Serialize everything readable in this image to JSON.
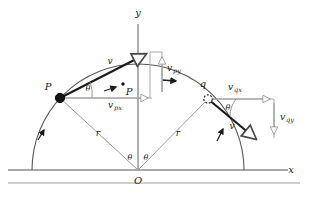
{
  "figure": {
    "background_color": "#ffffff",
    "stroke_dark": "#1a1a1a",
    "stroke_gray": "#8c8c8c",
    "stroke_mid": "#6e6e6e"
  },
  "axes": {
    "x_label": "x",
    "y_label": "y",
    "origin_label": "O"
  },
  "points": {
    "p_label": "P",
    "p_arc_label": "P",
    "q_label": "q"
  },
  "radii": {
    "left_label": "r",
    "right_label": "r"
  },
  "angles": {
    "at_p": "θ",
    "at_q": "θ",
    "at_origin_left": "θ",
    "at_origin_right": "θ"
  },
  "vectors": {
    "v_at_p": "v",
    "v_at_q": "v",
    "vpx_base": "v",
    "vpx_sub": "px",
    "vpy_base": "v",
    "vpy_sub": "py",
    "vqx_base": "v",
    "vqx_sub": "qx",
    "vqy_base": "v",
    "vqy_sub": "qy"
  },
  "geometry": {
    "origin": [
      138,
      170
    ],
    "radius": 106,
    "p_point": [
      60,
      98
    ],
    "q_point": [
      208,
      99
    ],
    "p_arc_marker": [
      123,
      88
    ],
    "v_p_tip": [
      150,
      50
    ],
    "v_q_tip": [
      260,
      143
    ],
    "arc_start_x": 32,
    "arc_end_x": 244,
    "ground_y": 170,
    "second_rule_y": 183
  }
}
